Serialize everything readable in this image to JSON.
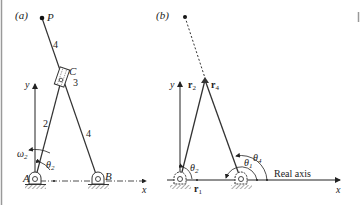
{
  "panel_a": {
    "label": "(a)",
    "point_p": "P",
    "slider_c": "C",
    "slider_number": "3",
    "link_2": "2",
    "link_4_upper": "4",
    "link_4_lower": "4",
    "pivot_a": "A",
    "pivot_b": "B",
    "axis_x": "x",
    "axis_y": "y",
    "omega": "ω",
    "omega_sub": "2",
    "theta": "θ",
    "theta_sub": "2"
  },
  "panel_b": {
    "label": "(b)",
    "axis_x": "x",
    "axis_y": "y",
    "r2": "r",
    "r2_sub": "2",
    "r4": "r",
    "r4_sub": "4",
    "r1": "r",
    "r1_sub": "1",
    "theta2": "θ",
    "theta2_sub": "2",
    "theta1": "θ",
    "theta1_sub": "1",
    "theta4": "θ",
    "theta4_sub": "4",
    "real_axis": "Real axis"
  },
  "colors": {
    "ink": "#222222",
    "hatch": "#555555",
    "frame_edge": "#999999"
  }
}
